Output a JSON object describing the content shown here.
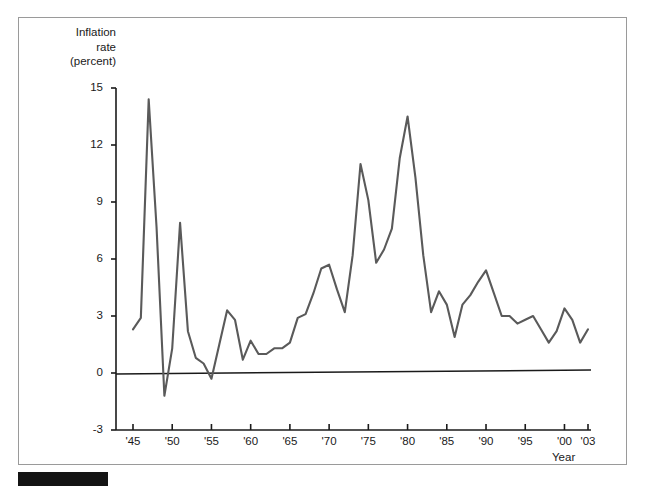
{
  "figure": {
    "y_axis_title_lines": [
      "Inflation",
      "rate",
      "(percent)"
    ],
    "x_axis_title": "Year"
  },
  "chart_data": {
    "type": "line",
    "title": "",
    "subtitle": "",
    "xlabel": "Year",
    "ylabel": "Inflation rate (percent)",
    "xlim": [
      1945,
      2003
    ],
    "ylim": [
      -3,
      15
    ],
    "grid": false,
    "legend": null,
    "y_ticks": [
      15,
      12,
      9,
      6,
      3,
      0,
      -3
    ],
    "y_tick_labels": [
      "15",
      "12",
      "9",
      "6",
      "3",
      "0",
      "-3"
    ],
    "x_ticks": [
      1945,
      1950,
      1955,
      1960,
      1965,
      1970,
      1975,
      1980,
      1985,
      1990,
      1995,
      2000,
      2003
    ],
    "x_tick_labels": [
      "'45",
      "'50",
      "'55",
      "'60",
      "'65",
      "'70",
      "'75",
      "'80",
      "'85",
      "'90",
      "'95",
      "'00",
      "'03"
    ],
    "zero_line": 0,
    "line_color": "#5a5a5a",
    "axis_color": "#1a1a1a",
    "series": [
      {
        "name": "Inflation rate",
        "x": [
          1945,
          1946,
          1947,
          1948,
          1949,
          1950,
          1951,
          1952,
          1953,
          1954,
          1955,
          1956,
          1957,
          1958,
          1959,
          1960,
          1961,
          1962,
          1963,
          1964,
          1965,
          1966,
          1967,
          1968,
          1969,
          1970,
          1971,
          1972,
          1973,
          1974,
          1975,
          1976,
          1977,
          1978,
          1979,
          1980,
          1981,
          1982,
          1983,
          1984,
          1985,
          1986,
          1987,
          1988,
          1989,
          1990,
          1991,
          1992,
          1993,
          1994,
          1995,
          1996,
          1997,
          1998,
          1999,
          2000,
          2001,
          2002,
          2003
        ],
        "values": [
          2.3,
          2.9,
          14.4,
          7.7,
          -1.2,
          1.3,
          7.9,
          2.2,
          0.8,
          0.5,
          -0.3,
          1.5,
          3.3,
          2.8,
          0.7,
          1.7,
          1.0,
          1.0,
          1.3,
          1.3,
          1.6,
          2.9,
          3.1,
          4.2,
          5.5,
          5.7,
          4.4,
          3.2,
          6.2,
          11.0,
          9.1,
          5.8,
          6.5,
          7.6,
          11.3,
          13.5,
          10.3,
          6.2,
          3.2,
          4.3,
          3.6,
          1.9,
          3.6,
          4.1,
          4.8,
          5.4,
          4.2,
          3.0,
          3.0,
          2.6,
          2.8,
          3.0,
          2.3,
          1.6,
          2.2,
          3.4,
          2.8,
          1.6,
          2.3
        ]
      }
    ]
  }
}
